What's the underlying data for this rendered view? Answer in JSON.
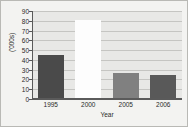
{
  "chart_data": {
    "type": "bar",
    "title": "",
    "xlabel": "Year",
    "ylabel": "('000s)",
    "categories": [
      "1995",
      "2000",
      "2005",
      "2006"
    ],
    "values": [
      44,
      80,
      26,
      24
    ],
    "ylim": [
      0,
      90
    ],
    "ytick_labels": [
      "0",
      "10",
      "20",
      "30",
      "40",
      "50",
      "60",
      "70",
      "80",
      "90"
    ],
    "ytick_values": [
      0,
      10,
      20,
      30,
      40,
      50,
      60,
      70,
      80,
      90
    ],
    "grid": "horizontal",
    "legend": "none",
    "bar_colors": [
      "#4a4a4a",
      "#fdfdfd",
      "#808080",
      "#595959"
    ],
    "plot_background": "#e8e8e6",
    "figure_background": "#f3f3f1",
    "gridline_color": "#c5c5c2",
    "axis_color": "#5a5a5a",
    "text_color": "#2a2a2a"
  }
}
